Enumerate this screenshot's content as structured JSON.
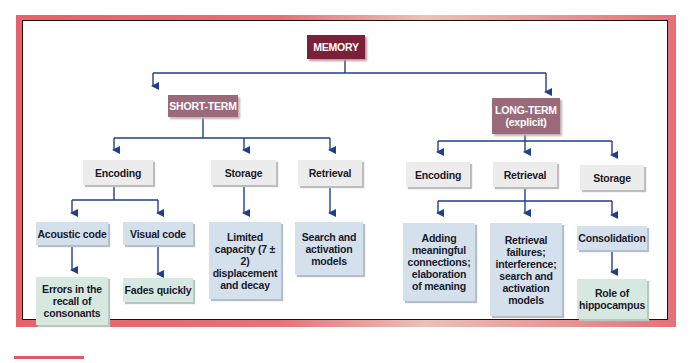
{
  "colors": {
    "frame": "#e8606a",
    "root_fill": "#7a2038",
    "branch_fill": "#9a6a7a",
    "stage_fill": "#ececec",
    "detail_fill": "#d4e0ec",
    "outcome_fill": "#d6e8e0",
    "arrow": "#1f3f8a"
  },
  "diagram": {
    "root": "MEMORY",
    "short_term": {
      "label": "SHORT-TERM",
      "stages": {
        "encoding": "Encoding",
        "storage": "Storage",
        "retrieval": "Retrieval"
      },
      "details": {
        "acoustic": "Acoustic code",
        "visual": "Visual code",
        "storage": "Limited capacity (7 ± 2) displacement and decay",
        "retrieval": "Search and activation models"
      },
      "outcomes": {
        "acoustic": "Errors in the recall of consonants",
        "visual": "Fades quickly"
      }
    },
    "long_term": {
      "label_line1": "LONG-TERM",
      "label_line2": "(explicit)",
      "stages": {
        "encoding": "Encoding",
        "retrieval": "Retrieval",
        "storage": "Storage"
      },
      "details": {
        "encoding": "Adding meaningful connections; elaboration of meaning",
        "retrieval": "Retrieval failures; interference; search and activation models",
        "storage": "Consolidation"
      },
      "outcomes": {
        "storage": "Role of hippocampus"
      }
    }
  }
}
